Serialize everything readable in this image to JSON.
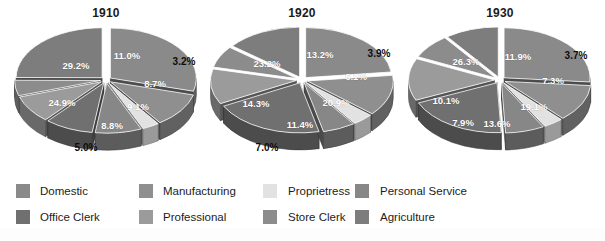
{
  "figure": {
    "background_color": "#ffffff",
    "label_text_color": "#ffffff",
    "outer_label_text_color": "#0d0d0d",
    "title_color": "#1a1a1a"
  },
  "categories": [
    {
      "key": "domestic",
      "label": "Domestic",
      "color": "#8a8a8a"
    },
    {
      "key": "manufacturing",
      "label": "Manufacturing",
      "color": "#8f8f8f"
    },
    {
      "key": "proprietress",
      "label": "Proprietress",
      "color": "#e2e2e2"
    },
    {
      "key": "personal_service",
      "label": "Personal Service",
      "color": "#878787"
    },
    {
      "key": "office_clerk",
      "label": "Office Clerk",
      "color": "#707070"
    },
    {
      "key": "professional",
      "label": "Professional",
      "color": "#9b9b9b"
    },
    {
      "key": "store_clerk",
      "label": "Store Clerk",
      "color": "#8c8c8c"
    },
    {
      "key": "agriculture",
      "label": "Agriculture",
      "color": "#7d7d7d"
    }
  ],
  "legend": {
    "rows": [
      [
        {
          "label": "Domestic",
          "color": "#8a8a8a"
        },
        {
          "label": "Manufacturing",
          "color": "#8f8f8f"
        },
        {
          "label": "Proprietress",
          "color": "#e2e2e2"
        },
        {
          "label": "Personal Service",
          "color": "#878787"
        }
      ],
      [
        {
          "label": "Office Clerk",
          "color": "#707070"
        },
        {
          "label": "Professional",
          "color": "#9b9b9b"
        },
        {
          "label": "Store Clerk",
          "color": "#8c8c8c"
        },
        {
          "label": "Agriculture",
          "color": "#7d7d7d"
        }
      ]
    ]
  },
  "chart_data": [
    {
      "type": "pie",
      "title": "1910",
      "exploded": true,
      "three_d": true,
      "labels": [
        "Domestic",
        "Manufacturing",
        "Proprietress",
        "Personal Service",
        "Office Clerk",
        "Professional",
        "Store Clerk",
        "Agriculture"
      ],
      "values": [
        29.2,
        11.0,
        3.2,
        8.7,
        9.1,
        8.8,
        5.0,
        24.9
      ],
      "value_labels": [
        "29.2%",
        "11.0%",
        "3.2%",
        "8.7%",
        "9.1%",
        "8.8%",
        "5.0%",
        "24.9%"
      ],
      "colors": [
        "#8a8a8a",
        "#8f8f8f",
        "#e2e2e2",
        "#878787",
        "#707070",
        "#9b9b9b",
        "#8c8c8c",
        "#7d7d7d"
      ],
      "units": "percent",
      "legend_position": "bottom"
    },
    {
      "type": "pie",
      "title": "1920",
      "exploded": true,
      "three_d": true,
      "labels": [
        "Domestic",
        "Manufacturing",
        "Proprietress",
        "Personal Service",
        "Office Clerk",
        "Professional",
        "Store Clerk",
        "Agriculture"
      ],
      "values": [
        23.2,
        13.2,
        3.9,
        6.1,
        20.9,
        11.4,
        7.0,
        14.3
      ],
      "value_labels": [
        "23.2%",
        "13.2%",
        "3.9%",
        "6.1%",
        "20.9%",
        "11.4%",
        "7.0%",
        "14.3%"
      ],
      "colors": [
        "#8a8a8a",
        "#8f8f8f",
        "#e2e2e2",
        "#878787",
        "#707070",
        "#9b9b9b",
        "#8c8c8c",
        "#7d7d7d"
      ],
      "units": "percent",
      "legend_position": "bottom"
    },
    {
      "type": "pie",
      "title": "1930",
      "exploded": true,
      "three_d": true,
      "labels": [
        "Domestic",
        "Manufacturing",
        "Proprietress",
        "Personal Service",
        "Office Clerk",
        "Professional",
        "Store Clerk",
        "Agriculture"
      ],
      "values": [
        26.3,
        11.9,
        3.7,
        7.3,
        19.1,
        13.6,
        7.9,
        10.1
      ],
      "value_labels": [
        "26.3%",
        "11.9%",
        "3.7%",
        "7.3%",
        "19.1%",
        "13.6%",
        "7.9%",
        "10.1%"
      ],
      "colors": [
        "#8a8a8a",
        "#8f8f8f",
        "#e2e2e2",
        "#878787",
        "#707070",
        "#9b9b9b",
        "#8c8c8c",
        "#7d7d7d"
      ],
      "units": "percent",
      "legend_position": "bottom"
    }
  ],
  "charts": {
    "c1910": {
      "title": "1910",
      "labels": {
        "domestic": "29.2%",
        "manufacturing": "11.0%",
        "proprietress": "3.2%",
        "personal_service": "8.7%",
        "office_clerk": "9.1%",
        "professional": "8.8%",
        "store_clerk": "5.0%",
        "agriculture": "24.9%"
      }
    },
    "c1920": {
      "title": "1920",
      "labels": {
        "domestic": "23.2%",
        "manufacturing": "13.2%",
        "proprietress": "3.9%",
        "personal_service": "6.1%",
        "office_clerk": "20.9%",
        "professional": "11.4%",
        "store_clerk": "7.0%",
        "agriculture": "14.3%"
      }
    },
    "c1930": {
      "title": "1930",
      "labels": {
        "domestic": "26.3%",
        "manufacturing": "11.9%",
        "proprietress": "3.7%",
        "personal_service": "7.3%",
        "office_clerk": "19.1%",
        "professional": "13.6%",
        "store_clerk": "7.9%",
        "agriculture": "10.1%"
      }
    }
  }
}
